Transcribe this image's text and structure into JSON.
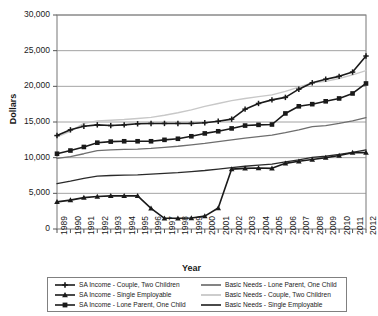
{
  "chart_data": {
    "type": "line",
    "title": "",
    "xlabel": "Year",
    "ylabel": "Dollars",
    "ylim": [
      0,
      30000
    ],
    "ytick_labels": [
      "0",
      "5,000",
      "10,000",
      "15,000",
      "20,000",
      "25,000",
      "30,000"
    ],
    "ytick_values": [
      0,
      5000,
      10000,
      15000,
      20000,
      25000,
      30000
    ],
    "grid": true,
    "legend_position": "below",
    "categories": [
      1989,
      1990,
      1991,
      1992,
      1993,
      1994,
      1995,
      1996,
      1997,
      1998,
      1999,
      2000,
      2001,
      2002,
      2003,
      2004,
      2005,
      2006,
      2007,
      2008,
      2009,
      2010,
      2011,
      2012
    ],
    "xtick_labels": [
      "1989",
      "1990",
      "1991",
      "1992",
      "1993",
      "1994",
      "1995",
      "1996",
      "1997",
      "1998",
      "1999",
      "2000",
      "2001",
      "2002",
      "2003",
      "2004",
      "2005",
      "2006",
      "2007",
      "2008",
      "2009",
      "2010",
      "2011",
      "2012"
    ],
    "series": [
      {
        "name": "SA Income - Couple, Two Children",
        "marker": "plus",
        "color": "#1a1a1a",
        "width": 1.6,
        "values": [
          13100,
          13900,
          14400,
          14600,
          14500,
          14600,
          14750,
          14800,
          14800,
          14800,
          14800,
          14900,
          15100,
          15400,
          16800,
          17600,
          18100,
          18450,
          19600,
          20500,
          21000,
          21400,
          22000,
          24250
        ]
      },
      {
        "name": "SA Income - Single Employable",
        "marker": "triangle",
        "color": "#1a1a1a",
        "width": 1.6,
        "values": [
          3800,
          4050,
          4400,
          4550,
          4650,
          4650,
          4650,
          2900,
          1500,
          1500,
          1550,
          1800,
          2950,
          8400,
          8500,
          8550,
          8500,
          9200,
          9500,
          9750,
          10000,
          10300,
          10700,
          10700
        ]
      },
      {
        "name": "SA Income - Lone Parent, One Child",
        "marker": "square",
        "color": "#1a1a1a",
        "width": 1.6,
        "values": [
          10550,
          11000,
          11500,
          12100,
          12250,
          12300,
          12300,
          12300,
          12500,
          12650,
          13000,
          13400,
          13700,
          14100,
          14500,
          14600,
          14650,
          16200,
          17200,
          17500,
          17900,
          18300,
          19000,
          20400
        ]
      },
      {
        "name": "Basic Needs - Lone Parent, One Child",
        "marker": "none",
        "color": "#6e6e6e",
        "width": 1.3,
        "values": [
          9900,
          10150,
          10550,
          11000,
          11100,
          11150,
          11200,
          11300,
          11450,
          11600,
          11800,
          12000,
          12250,
          12500,
          12750,
          12950,
          13150,
          13500,
          13900,
          14350,
          14500,
          14800,
          15150,
          15600
        ]
      },
      {
        "name": "Basic Needs - Couple, Two Children",
        "marker": "none",
        "color": "#c8c8c8",
        "width": 1.4,
        "values": [
          12900,
          13700,
          14800,
          15150,
          15250,
          15350,
          15500,
          15650,
          15950,
          16300,
          16700,
          17200,
          17600,
          18000,
          18300,
          18550,
          18800,
          19300,
          19900,
          20500,
          20700,
          21100,
          21600,
          22200
        ]
      },
      {
        "name": "Basic Needs - Single Employable",
        "marker": "none",
        "color": "#2a2a2a",
        "width": 1.3,
        "values": [
          6350,
          6700,
          7100,
          7400,
          7500,
          7550,
          7600,
          7700,
          7800,
          7900,
          8050,
          8200,
          8400,
          8600,
          8800,
          8950,
          9100,
          9400,
          9700,
          10050,
          10200,
          10450,
          10750,
          11100
        ]
      }
    ]
  },
  "legend": {
    "left_column": [
      "SA Income - Couple, Two Children",
      "SA Income - Single Employable",
      "SA Income - Lone Parent, One Child"
    ],
    "right_column": [
      "Basic Needs - Lone Parent, One Child",
      "Basic Needs - Couple, Two Children",
      "Basic Needs - Single Employable"
    ]
  }
}
